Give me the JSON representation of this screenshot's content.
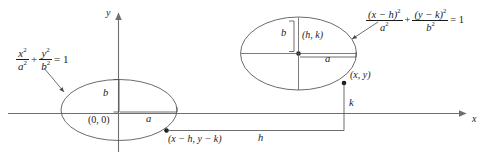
{
  "figure": {
    "axes": {
      "y_label": "y",
      "x_label": "x"
    },
    "left_ellipse": {
      "equation": {
        "num1": "x",
        "num1_exp": "2",
        "den1": "a",
        "den1_exp": "2",
        "plus": "+",
        "num2": "y",
        "num2_exp": "2",
        "den2": "b",
        "den2_exp": "2",
        "equals": "= 1"
      },
      "center_label": "(0, 0)",
      "semi_minor_label": "b",
      "semi_major_label": "a",
      "point_label": "(x − h, y − k)"
    },
    "right_ellipse": {
      "equation": {
        "num1": "(x − h)",
        "num1_exp": "2",
        "den1": "a",
        "den1_exp": "2",
        "plus": "+",
        "num2": "(y − k)",
        "num2_exp": "2",
        "den2": "b",
        "den2_exp": "2",
        "equals": "= 1"
      },
      "center_label": "(h, k)",
      "semi_minor_label": "b",
      "semi_major_label": "a",
      "point_label": "(x, y)"
    },
    "offsets": {
      "horizontal_label": "h",
      "vertical_label": "k"
    },
    "colors": {
      "ink": "#3a3a3a",
      "text": "#1a1a1a",
      "axis": "#6e6e6e",
      "background": "#ffffff"
    }
  }
}
